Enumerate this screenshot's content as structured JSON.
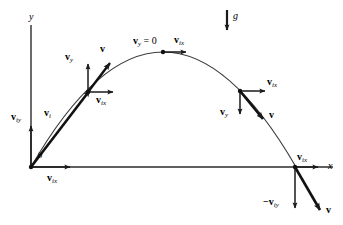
{
  "figure": {
    "type": "physics-vector-diagram",
    "stroke_color": "#1a1a1a",
    "background_color": "#ffffff"
  },
  "axes": {
    "x_label": "x",
    "y_label": "y",
    "origin": {
      "x": 31,
      "y": 167
    },
    "x_end": {
      "x": 320,
      "y": 167
    },
    "y_top": {
      "x": 31,
      "y": 25
    }
  },
  "gravity": {
    "label": "g",
    "arrow_x": 227,
    "arrow_y_start": 10,
    "arrow_y_end": 32
  },
  "trajectory": {
    "start": {
      "x": 31,
      "y": 167
    },
    "apex": {
      "x": 163,
      "y": 52
    },
    "end": {
      "x": 296,
      "y": 167
    }
  },
  "labels": {
    "angle": "θ",
    "v_initial": {
      "main": "v",
      "sub": "i"
    },
    "v_iy": {
      "main": "v",
      "sub": "iy"
    },
    "v_ix": {
      "main": "v",
      "sub": "ix"
    },
    "v_y": {
      "main": "v",
      "sub": "y"
    },
    "v": {
      "main": "v",
      "sub": ""
    },
    "v_y_zero": {
      "main": "v",
      "sub": "y",
      "suffix": " = 0"
    },
    "neg_v_iy": {
      "main": "−v",
      "sub": "iy"
    }
  },
  "annotations": [
    {
      "name": "y-axis-label",
      "text": "y",
      "x": 29,
      "y": 12
    },
    {
      "name": "x-axis-label",
      "text": "x",
      "x": 328,
      "y": 162
    },
    {
      "name": "gravity-label",
      "text": "g",
      "x": 233,
      "y": 12
    },
    {
      "name": "angle-theta-label",
      "text": "θ",
      "x": 38,
      "y": 152
    },
    {
      "name": "v-initial-label",
      "text": "v",
      "sub": "i",
      "x": 44,
      "y": 110
    },
    {
      "name": "v-iy-origin-label",
      "text": "v",
      "sub": "iy",
      "x": 12,
      "y": 113
    },
    {
      "name": "v-ix-origin-label",
      "text": "v",
      "sub": "ix",
      "x": 48,
      "y": 174
    },
    {
      "name": "v-y-ascending-label",
      "text": "v",
      "sub": "y",
      "x": 66,
      "y": 53
    },
    {
      "name": "v-resultant-ascending-label",
      "text": "v",
      "sub": "",
      "x": 100,
      "y": 45
    },
    {
      "name": "v-ix-ascending-label",
      "text": "v",
      "sub": "ix",
      "x": 97,
      "y": 96
    },
    {
      "name": "v-y-zero-apex-label",
      "text": "v",
      "sub": "y",
      "suffix": " = 0",
      "x": 134,
      "y": 37
    },
    {
      "name": "v-ix-apex-label",
      "text": "v",
      "sub": "ix",
      "x": 174,
      "y": 36
    },
    {
      "name": "v-ix-descending-label",
      "text": "v",
      "sub": "ix",
      "x": 268,
      "y": 78
    },
    {
      "name": "v-y-descending-label",
      "text": "v",
      "sub": "y",
      "x": 221,
      "y": 108
    },
    {
      "name": "v-resultant-descending-label",
      "text": "v",
      "sub": "",
      "x": 270,
      "y": 111
    },
    {
      "name": "v-ix-landing-label",
      "text": "v",
      "sub": "ix",
      "x": 297,
      "y": 153
    },
    {
      "name": "neg-v-iy-landing-label",
      "text": "−v",
      "sub": "iy",
      "x": 264,
      "y": 198
    },
    {
      "name": "v-resultant-landing-label",
      "text": "v",
      "sub": "",
      "x": 326,
      "y": 206
    }
  ],
  "vectors": [
    {
      "name": "initial-velocity-vector",
      "from": [
        31,
        167
      ],
      "to": [
        92,
        88
      ],
      "style": "thick"
    },
    {
      "name": "v-iy-initial-vector",
      "from": [
        31,
        167
      ],
      "to": [
        31,
        123
      ],
      "style": "thin"
    },
    {
      "name": "v-ix-initial-vector",
      "from": [
        31,
        167
      ],
      "to": [
        72,
        167
      ],
      "style": "thin"
    },
    {
      "name": "v-y-ascending-vector",
      "from": [
        88,
        92
      ],
      "to": [
        88,
        61
      ],
      "style": "thin"
    },
    {
      "name": "v-ix-ascending-vector",
      "from": [
        88,
        92
      ],
      "to": [
        115,
        92
      ],
      "style": "thin"
    },
    {
      "name": "v-resultant-ascending-vector",
      "from": [
        88,
        92
      ],
      "to": [
        112,
        60
      ],
      "style": "thick"
    },
    {
      "name": "v-ix-apex-vector",
      "from": [
        163,
        52
      ],
      "to": [
        189,
        52
      ],
      "style": "thin"
    },
    {
      "name": "v-ix-descending-vector",
      "from": [
        240,
        91
      ],
      "to": [
        268,
        91
      ],
      "style": "thin"
    },
    {
      "name": "v-y-descending-vector",
      "from": [
        240,
        91
      ],
      "to": [
        240,
        117
      ],
      "style": "thin"
    },
    {
      "name": "v-resultant-descending-vector",
      "from": [
        240,
        91
      ],
      "to": [
        265,
        122
      ],
      "style": "thick"
    },
    {
      "name": "v-ix-landing-vector",
      "from": [
        295,
        167
      ],
      "to": [
        321,
        167
      ],
      "style": "thin"
    },
    {
      "name": "neg-v-iy-landing-vector",
      "from": [
        295,
        167
      ],
      "to": [
        295,
        211
      ],
      "style": "thin"
    },
    {
      "name": "v-resultant-landing-vector",
      "from": [
        295,
        167
      ],
      "to": [
        322,
        213
      ],
      "style": "thick"
    }
  ],
  "points": [
    {
      "name": "launch-point",
      "x": 31,
      "y": 167
    },
    {
      "name": "ascending-point",
      "x": 88,
      "y": 92
    },
    {
      "name": "apex-point",
      "x": 163,
      "y": 52
    },
    {
      "name": "descending-point",
      "x": 240,
      "y": 91
    },
    {
      "name": "landing-point",
      "x": 295,
      "y": 167
    }
  ]
}
